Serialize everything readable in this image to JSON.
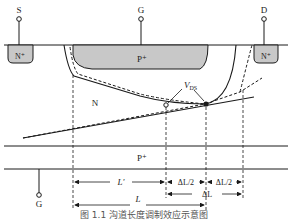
{
  "diagram": {
    "terminals": {
      "source": "S",
      "gate_top": "G",
      "drain": "D",
      "gate_bottom": "G"
    },
    "regions": {
      "source_diffusion": "N⁺",
      "gate_diffusion_top": "P⁺",
      "drain_diffusion": "N⁺",
      "channel": "N",
      "substrate_gate": "P⁺"
    },
    "annotations": {
      "vds_label": "V",
      "vds_sub": "DS",
      "l_prime": "L'",
      "delta_l_half_left": "ΔL/2",
      "delta_l_half_right": "ΔL/2",
      "delta_l": "ΔL",
      "l": "L"
    },
    "colors": {
      "diffusion_fill": "#c8c8c8",
      "line": "#1a1a1a"
    }
  },
  "caption": "图 1.1 沟道长度调制效应示意图"
}
